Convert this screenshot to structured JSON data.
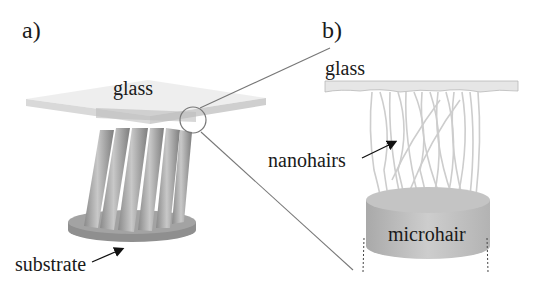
{
  "figure": {
    "panel_a": {
      "label": "a)",
      "glass_label": "glass",
      "substrate_label": "substrate"
    },
    "panel_b": {
      "label": "b)",
      "glass_label": "glass",
      "nanohairs_label": "nanohairs",
      "microhair_label": "microhair"
    }
  },
  "colors": {
    "glass": "#e2e2e2",
    "pillar": "#a8a8a8",
    "substrate": "#8e8e8e",
    "nanohair": "#cfcfcf",
    "microhair": "#bdbdbd",
    "text": "#1a1a1a"
  }
}
